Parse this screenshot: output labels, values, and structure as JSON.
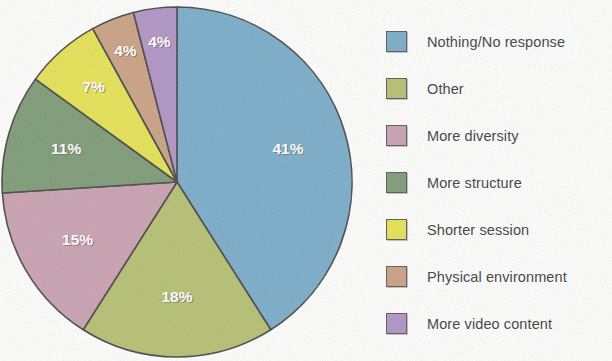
{
  "chart_data": {
    "type": "pie",
    "title": "",
    "legend_position": "right",
    "start_angle_deg": 0,
    "direction": "clockwise",
    "categories": [
      "Nothing/No response",
      "Other",
      "More diversity",
      "More structure",
      "Shorter session",
      "Physical environment",
      "More video content"
    ],
    "values": [
      41,
      18,
      15,
      11,
      7,
      4,
      4
    ],
    "value_labels": [
      "41%",
      "18%",
      "15%",
      "11%",
      "7%",
      "4%",
      "4%"
    ],
    "colors": [
      "#7aacc9",
      "#b5bf72",
      "#c9a1b0",
      "#7e9b76",
      "#e5e155",
      "#c9a183",
      "#b094c4"
    ],
    "slices": [
      {
        "label": "Nothing/No response",
        "value": 41,
        "value_label": "41%",
        "color": "#7aacc9"
      },
      {
        "label": "Other",
        "value": 18,
        "value_label": "18%",
        "color": "#b5bf72"
      },
      {
        "label": "More diversity",
        "value": 15,
        "value_label": "15%",
        "color": "#c9a1b0"
      },
      {
        "label": "More structure",
        "value": 11,
        "value_label": "11%",
        "color": "#7e9b76"
      },
      {
        "label": "Shorter session",
        "value": 7,
        "value_label": "7%",
        "color": "#e5e155"
      },
      {
        "label": "Physical environment",
        "value": 4,
        "value_label": "4%",
        "color": "#c9a183"
      },
      {
        "label": "More video content",
        "value": 4,
        "value_label": "4%",
        "color": "#b094c4"
      }
    ]
  },
  "legend": {
    "items": [
      {
        "label": "Nothing/No response",
        "color": "#7aacc9"
      },
      {
        "label": "Other",
        "color": "#b5bf72"
      },
      {
        "label": "More diversity",
        "color": "#c9a1b0"
      },
      {
        "label": "More structure",
        "color": "#7e9b76"
      },
      {
        "label": "Shorter session",
        "color": "#e5e155"
      },
      {
        "label": "Physical environment",
        "color": "#c9a183"
      },
      {
        "label": "More video content",
        "color": "#b094c4"
      }
    ]
  },
  "geometry": {
    "center_x": 177,
    "center_y": 182,
    "radius": 175,
    "label_radius_factor": 0.66
  }
}
